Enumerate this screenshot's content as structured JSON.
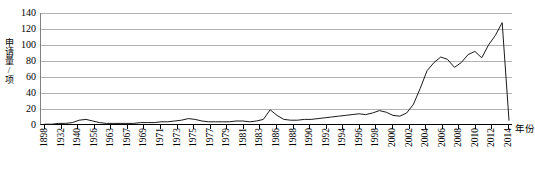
{
  "chart_data": {
    "type": "line",
    "title": "",
    "xlabel": "年份",
    "ylabel": "申请量/项",
    "ylim": [
      0,
      140
    ],
    "ytick_step": 20,
    "ytick_labels": [
      "140",
      "120",
      "100",
      "80",
      "60",
      "40",
      "20",
      "0"
    ],
    "grid": true,
    "legend": "none",
    "line_color": "#1a1a1a",
    "grid_color": "#b3b3b3",
    "axis_color": "#000000",
    "xtick_labels": [
      "1898",
      "1932",
      "1940",
      "1956",
      "1963",
      "1967",
      "1969",
      "1971",
      "1973",
      "1975",
      "1977",
      "1979",
      "1981",
      "1983",
      "1986",
      "1988",
      "1990",
      "1992",
      "1994",
      "1996",
      "1998",
      "2000",
      "2002",
      "2004",
      "2006",
      "2008",
      "2010",
      "2012",
      "2014"
    ],
    "x": [
      1898,
      1932,
      1934,
      1936,
      1938,
      1940,
      1942,
      1944,
      1946,
      1948,
      1950,
      1952,
      1954,
      1956,
      1958,
      1960,
      1962,
      1963,
      1964,
      1965,
      1966,
      1967,
      1968,
      1969,
      1970,
      1971,
      1972,
      1973,
      1974,
      1975,
      1976,
      1977,
      1978,
      1979,
      1980,
      1981,
      1982,
      1983,
      1984,
      1985,
      1986,
      1987,
      1988,
      1989,
      1990,
      1991,
      1992,
      1993,
      1994,
      1995,
      1996,
      1997,
      1998,
      1999,
      2000,
      2001,
      2002,
      2003,
      2004,
      2005,
      2006,
      2007,
      2008,
      2009,
      2010,
      2011,
      2012,
      2013,
      2014
    ],
    "values": [
      1,
      1,
      2,
      2,
      3,
      6,
      7,
      5,
      3,
      2,
      2,
      2,
      2,
      2,
      3,
      3,
      3,
      4,
      4,
      5,
      6,
      8,
      7,
      5,
      4,
      4,
      4,
      4,
      5,
      5,
      4,
      5,
      7,
      19,
      12,
      7,
      6,
      6,
      7,
      7,
      8,
      9,
      10,
      11,
      12,
      13,
      14,
      13,
      15,
      18,
      16,
      12,
      11,
      15,
      26,
      46,
      68,
      78,
      85,
      82,
      72,
      78,
      88,
      92,
      84,
      100,
      112,
      128,
      6
    ],
    "series": [
      {
        "name": "申请量",
        "values": [
          1,
          1,
          2,
          2,
          3,
          6,
          7,
          5,
          3,
          2,
          2,
          2,
          2,
          2,
          3,
          3,
          3,
          4,
          4,
          5,
          6,
          8,
          7,
          5,
          4,
          4,
          4,
          4,
          5,
          5,
          4,
          5,
          7,
          19,
          12,
          7,
          6,
          6,
          7,
          7,
          8,
          9,
          10,
          11,
          12,
          13,
          14,
          13,
          15,
          18,
          16,
          12,
          11,
          15,
          26,
          46,
          68,
          78,
          85,
          82,
          72,
          78,
          88,
          92,
          84,
          100,
          112,
          128,
          6
        ]
      }
    ],
    "peak": {
      "year": 2013,
      "value": 128
    }
  }
}
